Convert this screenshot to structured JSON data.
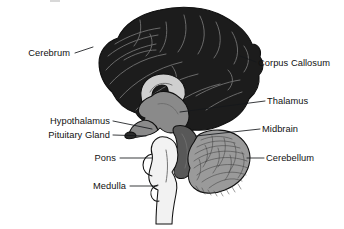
{
  "figure": {
    "background_color": "#ffffff",
    "width": 344,
    "height": 229
  },
  "palette": {
    "cerebrum": "#1c1c1c",
    "cerebrum_sulci": "#6e6e6e",
    "corpus_callosum": "#cfcfcf",
    "thalamus": "#8a8a8a",
    "midbrain": "#585858",
    "cerebellum": "#9a9a9a",
    "cerebellum_folia": "#3a3a3a",
    "brainstem": "#f2f2f2",
    "outline": "#101010",
    "label_text": "#111111",
    "leader_line": "#15181b"
  },
  "labels": [
    {
      "id": "cerebrum",
      "text": "Cerebrum",
      "side": "left",
      "text_x": 70,
      "text_y": 56,
      "leader": "M 75 53 L 93 47"
    },
    {
      "id": "corpus-callosum",
      "text": "Corpus Callosum",
      "side": "right",
      "text_x": 258,
      "text_y": 66,
      "leader": "M 256 62 L 240 56"
    },
    {
      "id": "thalamus",
      "text": "Thalamus",
      "side": "right",
      "text_x": 267,
      "text_y": 104,
      "leader": "M 265 101 L 180 112"
    },
    {
      "id": "hypothalamus",
      "text": "Hypothalamus",
      "side": "left",
      "text_x": 110,
      "text_y": 124,
      "leader": "M 113 121 L 152 129"
    },
    {
      "id": "pituitary-gland",
      "text": "Pituitary Gland",
      "side": "left",
      "text_x": 110,
      "text_y": 138,
      "leader": "M 113 135 L 146 136"
    },
    {
      "id": "midbrain",
      "text": "Midbrain",
      "side": "right",
      "text_x": 262,
      "text_y": 132,
      "leader": "M 260 129 L 196 136"
    },
    {
      "id": "pons",
      "text": "Pons",
      "side": "left",
      "text_x": 116,
      "text_y": 161,
      "leader": "M 120 158 L 152 158"
    },
    {
      "id": "cerebellum",
      "text": "Cerebellum",
      "side": "right",
      "text_x": 266,
      "text_y": 161,
      "leader": "M 264 158 L 247 158"
    },
    {
      "id": "medulla",
      "text": "Medulla",
      "side": "left",
      "text_x": 126,
      "text_y": 189,
      "leader": "M 130 186 L 157 186"
    }
  ],
  "structures": [
    {
      "id": "cerebrum",
      "name": "Cerebrum",
      "fill": "#1c1c1c"
    },
    {
      "id": "corpus-callosum",
      "name": "Corpus Callosum",
      "fill": "#cfcfcf"
    },
    {
      "id": "thalamus",
      "name": "Thalamus",
      "fill": "#8a8a8a"
    },
    {
      "id": "midbrain",
      "name": "Midbrain",
      "fill": "#585858"
    },
    {
      "id": "cerebellum",
      "name": "Cerebellum",
      "fill": "#9a9a9a"
    },
    {
      "id": "brainstem",
      "name": "Brainstem (Pons and Medulla)",
      "fill": "#f2f2f2"
    }
  ]
}
